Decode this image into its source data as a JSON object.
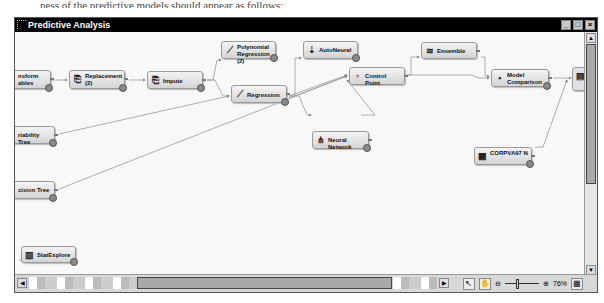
{
  "window": {
    "title": "Predictive Analysis",
    "controls": {
      "minimize": "_",
      "maximize": "□",
      "close": "×"
    }
  },
  "nodes": [
    {
      "id": "transform",
      "label": "Transform Variables",
      "visible_label": "nsform\nables",
      "icon": "transform-icon",
      "glyph": ""
    },
    {
      "id": "replacement",
      "label": "Replacement (2)",
      "icon": "replacement-icon",
      "glyph": "⎘"
    },
    {
      "id": "impute",
      "label": "Impute",
      "icon": "impute-icon",
      "glyph": "⎘"
    },
    {
      "id": "poly",
      "label": "Polynomial Regression (2)",
      "icon": "regression-icon",
      "glyph": "⟋"
    },
    {
      "id": "regression",
      "label": "Regression",
      "icon": "regression-icon",
      "glyph": "⟋"
    },
    {
      "id": "autoneural",
      "label": "AutoNeural",
      "icon": "autoneural-icon",
      "glyph": "⇣"
    },
    {
      "id": "controlpoint",
      "label": "Control Point",
      "icon": "control-point-icon",
      "glyph": "▫"
    },
    {
      "id": "ensemble",
      "label": "Ensemble",
      "icon": "ensemble-icon",
      "glyph": "≋"
    },
    {
      "id": "modelcomp",
      "label": "Model Comparison",
      "icon": "model-comparison-icon",
      "glyph": "▪"
    },
    {
      "id": "score",
      "label": "",
      "icon": "score-icon",
      "glyph": "▤"
    },
    {
      "id": "neuralnet",
      "label": "Neural Network",
      "icon": "neural-network-icon",
      "glyph": "⋔"
    },
    {
      "id": "corpva",
      "label": "CORPVA97 N",
      "icon": "data-table-icon",
      "glyph": "▦"
    },
    {
      "id": "vartree",
      "label": "Variability Tree",
      "visible_label": "riability Tree",
      "icon": "tree-icon",
      "glyph": ""
    },
    {
      "id": "dectree",
      "label": "Decision Tree",
      "visible_label": "cision Tree",
      "icon": "tree-icon",
      "glyph": ""
    },
    {
      "id": "statexplore",
      "label": "StatExplore",
      "icon": "statexplore-icon",
      "glyph": "▥"
    },
    {
      "id": "partial",
      "label": "Stat Exp",
      "icon": "node-icon",
      "glyph": "⌐"
    }
  ],
  "toolbar": {
    "select_tool": "↖",
    "pan_tool": "✋",
    "zoom_out": "⊖",
    "zoom_in": "⊕",
    "zoom_level": "76%",
    "layout_toggle": "▦"
  },
  "scroll": {
    "up": "▲",
    "down": "▼",
    "left": "◀",
    "right": "▶"
  },
  "caption": "ness of the predictive models should appear as follows:"
}
